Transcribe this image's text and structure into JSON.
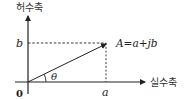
{
  "diagram": {
    "type": "complex-plane",
    "imaginary_axis_label": "허수축",
    "real_axis_label": "실수축",
    "origin_label": "0",
    "real_part_label": "a",
    "imaginary_part_label": "b",
    "angle_label": "θ",
    "point_label": "A=a+jb",
    "colors": {
      "line": "#222222",
      "text": "#222222",
      "background": "#ffffff"
    }
  }
}
